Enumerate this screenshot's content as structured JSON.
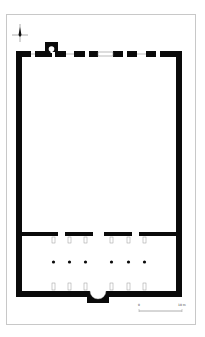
{
  "figure": {
    "type": "architectural floor plan",
    "background": "#ffffff",
    "frame_color": "#c8c8c8",
    "wall_color": "#0a0a0a"
  },
  "north_arrow": {
    "label": "N"
  },
  "scale_bar": {
    "start_label": "0",
    "end_label": "10 m"
  },
  "building": {
    "north_wall_openings": 7,
    "stair_turret": true,
    "crosswall_segments": 4,
    "column_rows": [
      {
        "name": "north-pilasters",
        "count": 6
      },
      {
        "name": "free-standing-columns",
        "count": 6
      },
      {
        "name": "south-pilasters",
        "count": 6
      }
    ],
    "apse": true
  }
}
